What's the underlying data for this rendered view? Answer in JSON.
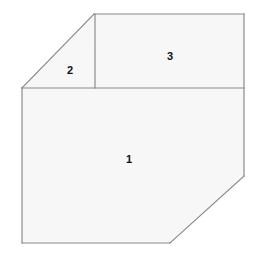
{
  "figure": {
    "type": "geometry-diagram",
    "canvas": {
      "width": 258,
      "height": 259
    },
    "colors": {
      "background": "#ffffff",
      "fill": "#f7f7f7",
      "stroke": "#8a8a8a",
      "label": "#111111"
    },
    "stroke_width": 1.2,
    "vertices": {
      "left_corner": [
        22,
        88
      ],
      "apex": [
        94,
        14
      ],
      "top_right": [
        244,
        14
      ],
      "right_lower": [
        244,
        176
      ],
      "diagonal_bottom": [
        170,
        243
      ],
      "bottom_left": [
        22,
        243
      ],
      "divider_top": [
        95,
        14
      ],
      "divider_bottom": [
        95,
        88
      ]
    },
    "regions": [
      {
        "id": "region-1",
        "label": "1",
        "shape": "pentagon",
        "label_x": 129,
        "label_y": 159,
        "points": "22,88 244,88 244,176 170,243 22,243"
      },
      {
        "id": "region-2",
        "label": "2",
        "shape": "triangle",
        "label_x": 70,
        "label_y": 70,
        "points": "22,88 94,14 95,88"
      },
      {
        "id": "region-3",
        "label": "3",
        "shape": "rectangle",
        "label_x": 170,
        "label_y": 56,
        "points": "95,14 244,14 244,88 95,88"
      }
    ],
    "edges": [
      {
        "id": "edge-hypotenuse",
        "from": [
          22,
          88
        ],
        "to": [
          94,
          14
        ]
      },
      {
        "id": "edge-top",
        "from": [
          94,
          14
        ],
        "to": [
          244,
          14
        ]
      },
      {
        "id": "edge-right",
        "from": [
          244,
          14
        ],
        "to": [
          244,
          176
        ]
      },
      {
        "id": "edge-diagonal",
        "from": [
          244,
          176
        ],
        "to": [
          170,
          243
        ]
      },
      {
        "id": "edge-bottom",
        "from": [
          170,
          243
        ],
        "to": [
          22,
          243
        ]
      },
      {
        "id": "edge-left",
        "from": [
          22,
          243
        ],
        "to": [
          22,
          88
        ]
      },
      {
        "id": "edge-horizontal-divider",
        "from": [
          22,
          88
        ],
        "to": [
          244,
          88
        ]
      },
      {
        "id": "edge-vertical-divider",
        "from": [
          95,
          14
        ],
        "to": [
          95,
          88
        ]
      }
    ]
  }
}
